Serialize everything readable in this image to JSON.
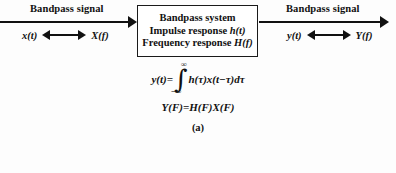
{
  "figure": {
    "caption": "(a)",
    "background_color": "#fdfdfd",
    "ink_color": "#111111"
  },
  "input": {
    "signal_label": "Bandpass signal",
    "time_symbol": "x(t)",
    "freq_symbol": "X(f)",
    "arrow": "double-headed-arrow"
  },
  "system": {
    "line1": "Bandpass system",
    "line2_prefix": "Impulse response ",
    "line2_symbol": "h(t)",
    "line3_prefix": "Frequency response ",
    "line3_symbol": "H(f)",
    "border_color": "#1a1a1a"
  },
  "output": {
    "signal_label": "Bandpass signal",
    "time_symbol": "y(t)",
    "freq_symbol": "Y(f)",
    "arrow": "double-headed-arrow"
  },
  "equations": {
    "convolution": {
      "lhs": "y(t)=",
      "integral_symbol": "∫",
      "upper_limit": "∞",
      "lower_limit": "−∞",
      "integrand": "h(τ)x(t−τ)dτ"
    },
    "frequency_domain": "Y(F)=H(F)X(F)"
  }
}
